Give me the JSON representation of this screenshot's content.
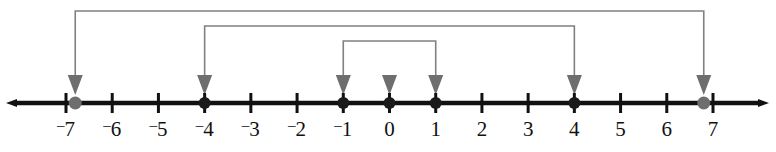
{
  "figure": {
    "type": "number-line-diagram",
    "title": "",
    "colors": {
      "axis": "#111111",
      "tick": "#111111",
      "label": "#111111",
      "bracket": "#808080",
      "arrow": "#6e6e6e",
      "point_dark": "#1a1a1a",
      "point_gray": "#6e6e6e",
      "background": "#ffffff"
    }
  },
  "chart_data": {
    "type": "number-line",
    "title": "",
    "xlabel": "",
    "ylabel": "",
    "xlim": [
      -7.6,
      7.6
    ],
    "axis_min": -7,
    "axis_max": 7,
    "tick_step": 1,
    "grid": false,
    "legend": "none",
    "left_arrowhead": true,
    "right_arrowhead": true,
    "tick_values": [
      -7,
      -6,
      -5,
      -4,
      -3,
      -2,
      -1,
      0,
      1,
      2,
      3,
      4,
      5,
      6,
      7
    ],
    "tick_labels": [
      "⁻7",
      "⁻6",
      "⁻5",
      "⁻4",
      "⁻3",
      "⁻2",
      "⁻1",
      "0",
      "1",
      "2",
      "3",
      "4",
      "5",
      "6",
      "7"
    ],
    "points": [
      {
        "value": -6.8,
        "style": "gray",
        "label": ""
      },
      {
        "value": -4,
        "style": "dark",
        "label": ""
      },
      {
        "value": -1,
        "style": "dark",
        "label": ""
      },
      {
        "value": 0,
        "style": "dark",
        "label": ""
      },
      {
        "value": 1,
        "style": "dark",
        "label": ""
      },
      {
        "value": 4,
        "style": "dark",
        "label": ""
      },
      {
        "value": 6.8,
        "style": "gray",
        "label": ""
      }
    ],
    "pointer_arrows": [
      {
        "value": -6.8,
        "has_stem": true
      },
      {
        "value": -4,
        "has_stem": true
      },
      {
        "value": -1,
        "has_stem": true
      },
      {
        "value": 0,
        "has_stem": false
      },
      {
        "value": 1,
        "has_stem": true
      },
      {
        "value": 4,
        "has_stem": true
      },
      {
        "value": 6.8,
        "has_stem": true
      }
    ],
    "brackets": [
      {
        "name": "outer-bracket",
        "from": -6.8,
        "to": 6.8,
        "top_y": 11
      },
      {
        "name": "middle-bracket",
        "from": -4,
        "to": 4,
        "top_y": 26
      },
      {
        "name": "inner-bracket",
        "from": -1,
        "to": 1,
        "top_y": 41
      }
    ]
  }
}
